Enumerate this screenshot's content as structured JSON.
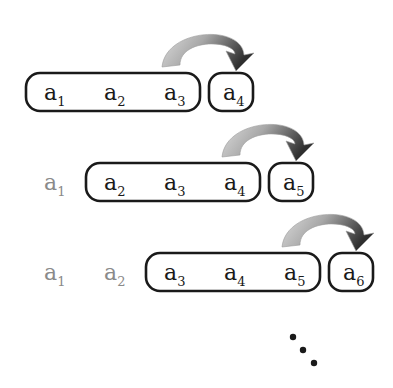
{
  "colors": {
    "ink": "#1a1a1a",
    "faded": "#8a8a8a",
    "arrow_light": "#d6d6d6",
    "arrow_dark": "#3a3a3a"
  },
  "rows": [
    {
      "faded": [],
      "window": [
        {
          "base": "a",
          "sub": "1"
        },
        {
          "base": "a",
          "sub": "2"
        },
        {
          "base": "a",
          "sub": "3"
        }
      ],
      "next": {
        "base": "a",
        "sub": "4"
      }
    },
    {
      "faded": [
        {
          "base": "a",
          "sub": "1"
        }
      ],
      "window": [
        {
          "base": "a",
          "sub": "2"
        },
        {
          "base": "a",
          "sub": "3"
        },
        {
          "base": "a",
          "sub": "4"
        }
      ],
      "next": {
        "base": "a",
        "sub": "5"
      }
    },
    {
      "faded": [
        {
          "base": "a",
          "sub": "1"
        },
        {
          "base": "a",
          "sub": "2"
        }
      ],
      "window": [
        {
          "base": "a",
          "sub": "3"
        },
        {
          "base": "a",
          "sub": "4"
        },
        {
          "base": "a",
          "sub": "5"
        }
      ],
      "next": {
        "base": "a",
        "sub": "6"
      }
    }
  ],
  "continuation": "diagonal-ellipsis-icon"
}
